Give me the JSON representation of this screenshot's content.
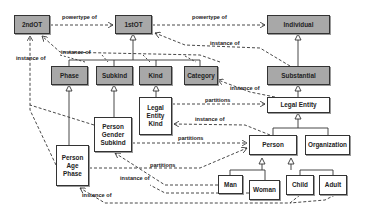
{
  "diagram": {
    "type": "ontology-class-diagram",
    "colors": {
      "metatype_fill": "#a8a8a8",
      "class_fill": "#ffffff",
      "stroke": "#333333"
    },
    "nodes": {
      "second_ot": "2ndOT",
      "first_ot": "1stOT",
      "individual": "Individual",
      "phase": "Phase",
      "subkind": "Subkind",
      "kind": "Kind",
      "category": "Category",
      "substantial": "Substantial",
      "legal_entity": "Legal Entity",
      "legal_entity_kind": "Legal Entity Kind",
      "person_gender_subkind": "Person Gender Subkind",
      "person_age_phase": "Person Age Phase",
      "person": "Person",
      "organization": "Organization",
      "man": "Man",
      "woman": "Woman",
      "child": "Child",
      "adult": "Adult"
    },
    "edge_labels": {
      "powertype_1": "powertype of",
      "powertype_2": "powertype of",
      "instance_1st_to_2nd": "instance of",
      "instance_left": "instance of",
      "instance_substantial": "instance of",
      "instance_category": "instance of",
      "partitions_legal_entity": "partitions",
      "instance_lek": "instance of",
      "partitions_pgs": "partitions",
      "partitions_pap": "partitions",
      "instance_pgs": "instance of",
      "instance_pap": "instance of"
    },
    "edges": [
      {
        "from": "2ndOT",
        "to": "1stOT",
        "label": "powertype of",
        "style": "dashed"
      },
      {
        "from": "1stOT",
        "to": "Individual",
        "label": "powertype of",
        "style": "dashed"
      },
      {
        "from": "1stOT",
        "to": "2ndOT",
        "label": "instance of",
        "style": "dashed"
      },
      {
        "from": "Phase/Subkind/Kind/Category",
        "to": "1stOT",
        "label": "generalization",
        "style": "solid"
      },
      {
        "from": "Substantial",
        "to": "1stOT",
        "label": "instance of",
        "style": "dashed"
      },
      {
        "from": "Substantial",
        "to": "Individual",
        "label": "generalization",
        "style": "solid"
      },
      {
        "from": "Legal Entity",
        "to": "Substantial",
        "label": "generalization",
        "style": "solid"
      },
      {
        "from": "Legal Entity",
        "to": "Category",
        "label": "instance of",
        "style": "dashed"
      },
      {
        "from": "Legal Entity Kind",
        "to": "Legal Entity",
        "label": "partitions",
        "style": "dashed"
      },
      {
        "from": "Legal Entity Kind",
        "to": "Kind",
        "label": "generalization",
        "style": "solid"
      },
      {
        "from": "Person",
        "to": "Legal Entity Kind",
        "label": "instance of",
        "style": "dashed"
      },
      {
        "from": "Person Gender Subkind",
        "to": "Person",
        "label": "partitions",
        "style": "dashed"
      },
      {
        "from": "Person Age Phase",
        "to": "Person",
        "label": "partitions",
        "style": "dashed"
      },
      {
        "from": "Man/Woman",
        "to": "Person Gender Subkind",
        "label": "instance of",
        "style": "dashed"
      },
      {
        "from": "Child/Adult",
        "to": "Person Age Phase",
        "label": "instance of",
        "style": "dashed"
      },
      {
        "from": "Person Age Phase",
        "to": "2ndOT",
        "label": "instance of",
        "style": "dashed"
      }
    ]
  }
}
